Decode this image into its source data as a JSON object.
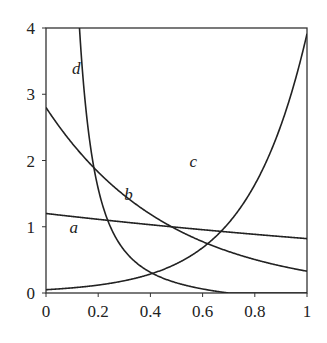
{
  "chart_data": {
    "type": "line",
    "title": "",
    "xlabel": "",
    "ylabel": "",
    "xlim": [
      0,
      1
    ],
    "ylim": [
      0,
      4
    ],
    "grid": false,
    "legend": "inline curve labels",
    "x_ticks": [
      "0",
      "0.2",
      "0.4",
      "0.6",
      "0.8",
      "1"
    ],
    "y_ticks": [
      "0",
      "1",
      "2",
      "3",
      "4"
    ],
    "x": [
      0,
      0.05,
      0.1,
      0.15,
      0.2,
      0.25,
      0.3,
      0.35,
      0.4,
      0.45,
      0.5,
      0.55,
      0.6,
      0.65,
      0.7,
      0.75,
      0.8,
      0.85,
      0.9,
      0.95,
      1.0
    ],
    "series": [
      {
        "name": "a",
        "values": [
          1.2,
          1.18,
          1.16,
          1.13,
          1.11,
          1.09,
          1.07,
          1.05,
          1.03,
          1.01,
          0.99,
          0.97,
          0.95,
          0.93,
          0.92,
          0.9,
          0.88,
          0.86,
          0.85,
          0.83,
          0.82
        ]
      },
      {
        "name": "b",
        "values": [
          2.8,
          2.52,
          2.26,
          2.03,
          1.83,
          1.64,
          1.48,
          1.33,
          1.19,
          1.07,
          0.96,
          0.86,
          0.78,
          0.7,
          0.63,
          0.56,
          0.5,
          0.45,
          0.41,
          0.37,
          0.33
        ]
      },
      {
        "name": "c",
        "values": [
          0.05,
          0.06,
          0.08,
          0.1,
          0.12,
          0.15,
          0.19,
          0.23,
          0.29,
          0.36,
          0.44,
          0.55,
          0.68,
          0.85,
          1.05,
          1.3,
          1.6,
          1.99,
          2.46,
          3.1,
          3.9
        ]
      },
      {
        "name": "d",
        "values": [
          null,
          null,
          3.5,
          2.3,
          1.55,
          1.08,
          0.76,
          0.53,
          0.37,
          0.26,
          0.18,
          0.12,
          0.08,
          0.05,
          0.03,
          0.02,
          0.01,
          0.0,
          0.0,
          0.0,
          0.0
        ]
      }
    ],
    "annotations": [
      {
        "text": "a",
        "x": 0.09,
        "y": 0.9
      },
      {
        "text": "b",
        "x": 0.3,
        "y": 1.4
      },
      {
        "text": "c",
        "x": 0.55,
        "y": 1.9
      },
      {
        "text": "d",
        "x": 0.1,
        "y": 3.3
      }
    ]
  }
}
